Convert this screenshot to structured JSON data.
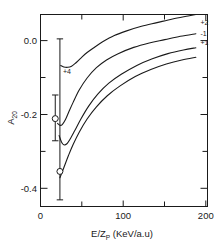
{
  "chart_data": {
    "type": "line",
    "title": "",
    "xlabel": "E/Z_P (KeV/a.u)",
    "xlabel_main": "E/Z",
    "xlabel_sub": "P",
    "xlabel_units": "(KeV/a.u)",
    "ylabel": "A20",
    "ylabel_main": "A",
    "ylabel_sub": "20",
    "xlim": [
      0,
      215
    ],
    "ylim": [
      -0.45,
      0.07
    ],
    "grid": false,
    "legend_position": "inline-right",
    "xticks_major": [
      0,
      100,
      200
    ],
    "xticks_minor": [
      50,
      150
    ],
    "xtick_labels": [
      "0",
      "100",
      "200"
    ],
    "yticks_major": [
      0.0,
      -0.2,
      -0.4
    ],
    "ytick_labels": [
      "0.0",
      "-0.2",
      "-0.4"
    ],
    "yticks_minor": [
      -0.1,
      -0.3
    ],
    "series": [
      {
        "name": "+4",
        "label": "+4",
        "label_position": "left-below-minimum",
        "points": [
          [
            26,
            -0.068
          ],
          [
            30,
            -0.072
          ],
          [
            35,
            -0.073
          ],
          [
            40,
            -0.07
          ],
          [
            45,
            -0.062
          ],
          [
            52,
            -0.048
          ],
          [
            60,
            -0.033
          ],
          [
            70,
            -0.018
          ],
          [
            80,
            -0.004
          ],
          [
            95,
            0.013
          ],
          [
            110,
            0.025
          ],
          [
            130,
            0.038
          ],
          [
            150,
            0.048
          ],
          [
            170,
            0.058
          ],
          [
            190,
            0.066
          ],
          [
            200,
            0.07
          ]
        ]
      },
      {
        "name": "+2",
        "label": "+2",
        "label_position": "right-end",
        "points": [
          [
            22,
            -0.225
          ],
          [
            25,
            -0.23
          ],
          [
            28,
            -0.228
          ],
          [
            32,
            -0.215
          ],
          [
            36,
            -0.196
          ],
          [
            42,
            -0.168
          ],
          [
            50,
            -0.134
          ],
          [
            60,
            -0.102
          ],
          [
            72,
            -0.074
          ],
          [
            85,
            -0.053
          ],
          [
            100,
            -0.036
          ],
          [
            120,
            -0.019
          ],
          [
            140,
            -0.007
          ],
          [
            160,
            0.002
          ],
          [
            180,
            0.011
          ],
          [
            200,
            0.018
          ]
        ]
      },
      {
        "name": "-1",
        "label": "-1",
        "label_position": "right-end",
        "points": [
          [
            24,
            -0.258
          ],
          [
            27,
            -0.275
          ],
          [
            30,
            -0.283
          ],
          [
            34,
            -0.28
          ],
          [
            38,
            -0.268
          ],
          [
            44,
            -0.245
          ],
          [
            52,
            -0.213
          ],
          [
            62,
            -0.178
          ],
          [
            74,
            -0.145
          ],
          [
            88,
            -0.116
          ],
          [
            104,
            -0.092
          ],
          [
            124,
            -0.068
          ],
          [
            144,
            -0.05
          ],
          [
            164,
            -0.036
          ],
          [
            184,
            -0.026
          ],
          [
            200,
            -0.02
          ]
        ]
      },
      {
        "name": "+1",
        "label": "+1",
        "label_position": "right-end",
        "points": [
          [
            25,
            -0.372
          ],
          [
            30,
            -0.345
          ],
          [
            36,
            -0.312
          ],
          [
            42,
            -0.282
          ],
          [
            50,
            -0.248
          ],
          [
            60,
            -0.213
          ],
          [
            72,
            -0.18
          ],
          [
            86,
            -0.15
          ],
          [
            102,
            -0.124
          ],
          [
            122,
            -0.098
          ],
          [
            142,
            -0.079
          ],
          [
            162,
            -0.064
          ],
          [
            182,
            -0.053
          ],
          [
            200,
            -0.046
          ]
        ]
      }
    ],
    "data_points": [
      {
        "name": "experimental-point-1",
        "x": 19,
        "y": -0.212,
        "yerr_low": -0.272,
        "yerr_high": -0.148,
        "marker": "open-circle"
      },
      {
        "name": "experimental-point-2",
        "x": 25,
        "y": -0.355,
        "yerr_low": -0.432,
        "yerr_high": 0.004,
        "marker": "open-circle"
      }
    ],
    "annotations": [
      {
        "text": "+4",
        "x": 34,
        "y": -0.092
      },
      {
        "text": "+2",
        "x": 206,
        "y": 0.042
      },
      {
        "text": "-1",
        "x": 206,
        "y": 0.012
      },
      {
        "text": "+1",
        "x": 206,
        "y": -0.012
      }
    ],
    "colors": {
      "line": "#1a1a1a",
      "axis": "#1a1a1a",
      "background": "#ffffff"
    }
  }
}
